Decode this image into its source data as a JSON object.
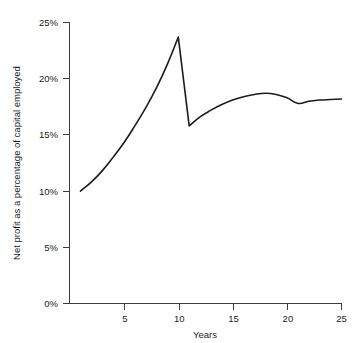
{
  "chart_data": {
    "type": "line",
    "title": "",
    "xlabel": "Years",
    "ylabel": "Net profit as a percentage of capital employed",
    "xlim": [
      0,
      25
    ],
    "ylim": [
      0,
      25
    ],
    "grid": false,
    "legend": "none",
    "x_ticks": [
      5,
      10,
      15,
      20,
      25
    ],
    "x_tick_labels": [
      "5",
      "10",
      "15",
      "20",
      "25"
    ],
    "y_ticks": [
      0,
      5,
      10,
      15,
      20,
      25
    ],
    "y_tick_labels": [
      "0%",
      "5%",
      "10%",
      "15%",
      "20%",
      "25%"
    ],
    "series": [
      {
        "name": "Net profit as a percentage of capital employed",
        "color": "#1b1b1b",
        "x": [
          1,
          2,
          3,
          4,
          5,
          6,
          7,
          8,
          9,
          10,
          11,
          12,
          13,
          14,
          15,
          16,
          17,
          18,
          19,
          20,
          21,
          22,
          23,
          24,
          25
        ],
        "values": [
          10.0,
          10.8,
          11.8,
          13.0,
          14.3,
          15.8,
          17.4,
          19.2,
          21.3,
          23.7,
          15.8,
          16.6,
          17.2,
          17.7,
          18.1,
          18.4,
          18.6,
          18.7,
          18.6,
          18.3,
          17.8,
          18.0,
          18.1,
          18.15,
          18.2
        ]
      }
    ],
    "annotations": {
      "peak_year": 10,
      "peak_value": 23.7,
      "trough_year": 11,
      "trough_value": 15.8,
      "start_value": 10.0,
      "end_value": 18.2
    }
  },
  "axis": {
    "x_title": "Years",
    "y_title": "Net profit as a percentage of capital employed"
  },
  "ticks": {
    "y": [
      "25%",
      "20%",
      "15%",
      "10%",
      "5%",
      "0%"
    ],
    "x": [
      "5",
      "10",
      "15",
      "20",
      "25"
    ]
  }
}
